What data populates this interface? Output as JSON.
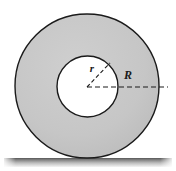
{
  "figure": {
    "type": "geometry-diagram",
    "canvas": {
      "width": 176,
      "height": 171,
      "background": "#ffffff"
    },
    "labels": {
      "inner_radius": "r",
      "outer_radius": "R"
    },
    "shapes": {
      "outer_disk": {
        "name": "outer-circle",
        "cx": 87,
        "cy": 86,
        "radius": 72,
        "fill": "#c4c4c4",
        "stroke": "#1a1a1a",
        "stroke_width": 1.4
      },
      "inner_hole": {
        "name": "inner-circle",
        "cx": 87.5,
        "cy": 86.5,
        "radius": 30.5,
        "fill": "#ffffff",
        "stroke": "#1a1a1a",
        "stroke_width": 1.4
      },
      "ground": {
        "name": "ground-surface",
        "x": 4,
        "y": 158,
        "width": 168,
        "height": 9,
        "top_color": "#5a5a5a",
        "bottom_color": "#f2f2f2"
      }
    },
    "leaders": {
      "outer_radius_line": {
        "name": "outer-radius-dashed-line",
        "x1": 87,
        "y1": 87,
        "x2": 168,
        "y2": 87,
        "dash": "5,3",
        "color": "#1a1a1a"
      },
      "inner_radius_line": {
        "name": "inner-radius-dashed-line",
        "x1": 87,
        "y1": 87,
        "x2": 110,
        "y2": 63,
        "dash": "4,2.5",
        "color": "#1a1a1a"
      }
    },
    "label_positions": {
      "r": {
        "x": 92,
        "y": 72
      },
      "R": {
        "x": 128,
        "y": 79
      }
    },
    "colors": {
      "disk_fill": "#c4c4c4",
      "hole_fill": "#ffffff",
      "outline": "#1a1a1a",
      "ground_dark": "#5a5a5a",
      "background": "#ffffff"
    }
  }
}
